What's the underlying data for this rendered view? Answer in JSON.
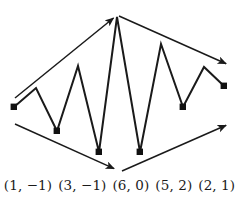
{
  "figure": {
    "title": "",
    "stroke_color": "#1a1a1a",
    "marker_color": "#111111",
    "background_color": "#ffffff"
  },
  "labels": {
    "items": [
      {
        "text": "(1, −1)"
      },
      {
        "text": "(3, −1)"
      },
      {
        "text": "(6, 0)"
      },
      {
        "text": "(5, 2)"
      },
      {
        "text": "(2, 1)"
      }
    ]
  },
  "chart_data": {
    "type": "line",
    "title": "",
    "xlabel": "",
    "ylabel": "",
    "grid": false,
    "legend": null,
    "xlim": [
      0,
      239
    ],
    "ylim": [
      206,
      0
    ],
    "series": [
      {
        "name": "zigzag-path",
        "points": [
          [
            14,
            107
          ],
          [
            36,
            88
          ],
          [
            57,
            131
          ],
          [
            78,
            66
          ],
          [
            99,
            152
          ],
          [
            117,
            17
          ],
          [
            140,
            152
          ],
          [
            161,
            44
          ],
          [
            183,
            107
          ],
          [
            204,
            67
          ],
          [
            224,
            86
          ]
        ],
        "marker_indices": [
          0,
          2,
          4,
          6,
          8,
          10
        ]
      }
    ],
    "annotations": [
      {
        "name": "upper-left-arrow",
        "from": [
          15,
          98
        ],
        "to": [
          116,
          16
        ]
      },
      {
        "name": "upper-right-arrow",
        "from": [
          119,
          16
        ],
        "to": [
          229,
          65
        ]
      },
      {
        "name": "lower-left-arrow",
        "from": [
          15,
          124
        ],
        "to": [
          117,
          170
        ]
      },
      {
        "name": "lower-right-arrow",
        "from": [
          122,
          171
        ],
        "to": [
          229,
          124
        ]
      }
    ],
    "tick_labels": [
      "(1, −1)",
      "(3, −1)",
      "(6, 0)",
      "(5, 2)",
      "(2, 1)"
    ]
  }
}
